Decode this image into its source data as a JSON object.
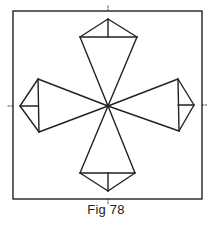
{
  "figure": {
    "caption": "Fig 78",
    "stroke_color": "#222222",
    "background": "#ffffff",
    "frame": {
      "x": 13,
      "y": 11,
      "width": 189,
      "height": 188
    },
    "center": {
      "x": 108,
      "y": 106
    },
    "center_marks": {
      "top": {
        "x": 108,
        "y1": 6,
        "y2": 11
      },
      "bottom": {
        "x": 108,
        "y1": 199,
        "y2": 204
      },
      "left": {
        "y": 106,
        "x1": 8,
        "x2": 13
      },
      "right": {
        "y": 105,
        "x1": 202,
        "x2": 207
      }
    },
    "kites": [
      {
        "name": "top",
        "apex": [
          108,
          19
        ],
        "base_a": [
          80,
          37
        ],
        "base_b": [
          137,
          37
        ],
        "axis_end": [
          108,
          37
        ]
      },
      {
        "name": "right",
        "apex": [
          194,
          105
        ],
        "base_a": [
          178,
          79
        ],
        "base_b": [
          179,
          131
        ],
        "axis_end": [
          178,
          105
        ]
      },
      {
        "name": "bottom",
        "apex": [
          108,
          191
        ],
        "base_a": [
          80,
          173
        ],
        "base_b": [
          135,
          173
        ],
        "axis_end": [
          108,
          173
        ]
      },
      {
        "name": "left",
        "apex": [
          20,
          106
        ],
        "base_a": [
          38,
          79
        ],
        "base_b": [
          39,
          132
        ],
        "axis_end": [
          38,
          106
        ]
      }
    ]
  }
}
